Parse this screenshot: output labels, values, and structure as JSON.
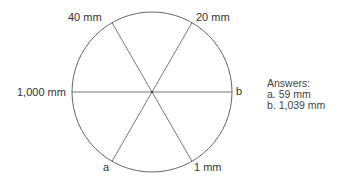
{
  "diagram": {
    "type": "circle divided by three diameters into six sectors",
    "center": [
      152,
      92
    ],
    "radius": 80,
    "labels": {
      "top_left": "40 mm",
      "top_right": "20 mm",
      "left": "1,000 mm",
      "right": "b",
      "bottom_left": "a",
      "bottom_right": "1 mm"
    },
    "stroke_color": "#555555"
  },
  "answers": {
    "title": "Answers:",
    "items": [
      "a.  59 mm",
      "b.  1,039 mm"
    ]
  }
}
